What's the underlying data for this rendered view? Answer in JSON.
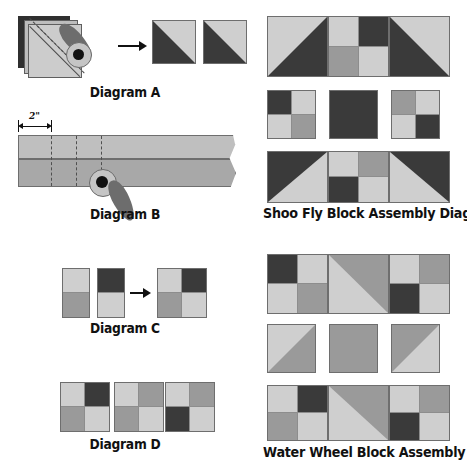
{
  "page": {
    "background": "#ffffff"
  },
  "palette": {
    "dark": "#3a3a3a",
    "medium": "#9a9a9a",
    "light": "#cfcfcf",
    "outline": "#6e6e6e",
    "text": "#111111",
    "cutter_handle": "#6d6d6d",
    "cutter_blade": "#c5c5c5",
    "cutter_hub": "#111111"
  },
  "captions": {
    "diagram_a": "Diagram A",
    "diagram_b": "Diagram B",
    "diagram_c": "Diagram C",
    "diagram_d": "Diagram D",
    "shoo_fly": "Shoo Fly Block Assembly Diagram",
    "water_wheel": "Water Wheel Block Assembly Diagram"
  },
  "diagram_a": {
    "caption": "Diagram A",
    "description": "Two fabric squares layered right sides together, marked with a diagonal line and stitched on both sides, then cut apart with a rotary cutter",
    "layer_count": 2,
    "stitch_lines": 2,
    "results": [
      {
        "name": "half-square-triangle",
        "lower_left": "dark",
        "upper_right": "light"
      },
      {
        "name": "half-square-triangle",
        "lower_left": "dark",
        "upper_right": "light"
      }
    ],
    "arrow": "right-arrow"
  },
  "diagram_b": {
    "caption": "Diagram B",
    "description": "Two sewn strips cut into segments with a rotary cutter",
    "dimension_label": "2\"",
    "strip_rows": 2,
    "strip_top_tone": "light",
    "strip_bottom_tone": "medium",
    "cut_lines": 3,
    "torn_edge": true
  },
  "diagram_c": {
    "caption": "Diagram C",
    "description": "Two two-patch segments joined to form a four-patch unit",
    "segments": [
      {
        "name": "two-patch-left",
        "top": "light",
        "bottom": "medium"
      },
      {
        "name": "two-patch-right",
        "top": "dark",
        "bottom": "light"
      }
    ],
    "arrow": "right-arrow",
    "result": {
      "name": "four-patch",
      "patches": [
        "light",
        "dark",
        "medium",
        "light"
      ]
    }
  },
  "diagram_d": {
    "caption": "Diagram D",
    "description": "Three completed four-patch units",
    "units": [
      {
        "name": "four-patch-1",
        "patches": [
          "light",
          "dark",
          "medium",
          "light"
        ]
      },
      {
        "name": "four-patch-2",
        "patches": [
          "light",
          "medium",
          "medium",
          "light"
        ]
      },
      {
        "name": "four-patch-3",
        "patches": [
          "light",
          "medium",
          "dark",
          "light"
        ]
      }
    ]
  },
  "shoo_fly": {
    "caption": "Shoo Fly Block Assembly Diagram",
    "rows": [
      {
        "name": "shoo-fly-row-top",
        "units": [
          {
            "name": "half-square-triangle",
            "type": "hst",
            "base": "light",
            "triangle": "dark",
            "corner": "bottom-left"
          },
          {
            "name": "four-patch",
            "type": "four-patch",
            "patches": [
              "light",
              "dark",
              "medium",
              "light"
            ]
          },
          {
            "name": "half-square-triangle",
            "type": "hst",
            "base": "light",
            "triangle": "dark",
            "corner": "bottom-right"
          }
        ]
      },
      {
        "name": "shoo-fly-row-middle",
        "units": [
          {
            "name": "four-patch",
            "type": "four-patch",
            "patches": [
              "dark",
              "light",
              "light",
              "medium"
            ]
          },
          {
            "name": "solid-square",
            "type": "solid",
            "tone": "dark"
          },
          {
            "name": "four-patch",
            "type": "four-patch",
            "patches": [
              "medium",
              "light",
              "light",
              "dark"
            ]
          }
        ]
      },
      {
        "name": "shoo-fly-row-bottom",
        "units": [
          {
            "name": "half-square-triangle",
            "type": "hst",
            "base": "light",
            "triangle": "dark",
            "corner": "top-left"
          },
          {
            "name": "four-patch",
            "type": "four-patch",
            "patches": [
              "light",
              "medium",
              "dark",
              "light"
            ]
          },
          {
            "name": "half-square-triangle",
            "type": "hst",
            "base": "light",
            "triangle": "dark",
            "corner": "top-right"
          }
        ]
      }
    ]
  },
  "water_wheel": {
    "caption": "Water Wheel Block Assembly Diagram",
    "rows": [
      {
        "name": "water-wheel-row-top",
        "units": [
          {
            "name": "four-patch",
            "type": "four-patch",
            "patches": [
              "dark",
              "light",
              "light",
              "medium"
            ]
          },
          {
            "name": "half-square-triangle",
            "type": "hst",
            "base": "light",
            "triangle": "medium",
            "corner": "bottom-left"
          },
          {
            "name": "four-patch",
            "type": "four-patch",
            "patches": [
              "light",
              "medium",
              "dark",
              "light"
            ]
          }
        ]
      },
      {
        "name": "water-wheel-row-middle",
        "units": [
          {
            "name": "half-square-triangle",
            "type": "hst",
            "base": "light",
            "triangle": "medium",
            "corner": "bottom-right"
          },
          {
            "name": "solid-square",
            "type": "solid",
            "tone": "medium"
          },
          {
            "name": "half-square-triangle",
            "type": "hst",
            "base": "light",
            "triangle": "medium",
            "corner": "top-left"
          }
        ]
      },
      {
        "name": "water-wheel-row-bottom",
        "units": [
          {
            "name": "four-patch",
            "type": "four-patch",
            "patches": [
              "light",
              "dark",
              "medium",
              "light"
            ]
          },
          {
            "name": "half-square-triangle",
            "type": "hst",
            "base": "light",
            "triangle": "medium",
            "corner": "top-right"
          },
          {
            "name": "four-patch",
            "type": "four-patch",
            "patches": [
              "light",
              "medium",
              "dark",
              "light"
            ]
          }
        ]
      }
    ]
  }
}
